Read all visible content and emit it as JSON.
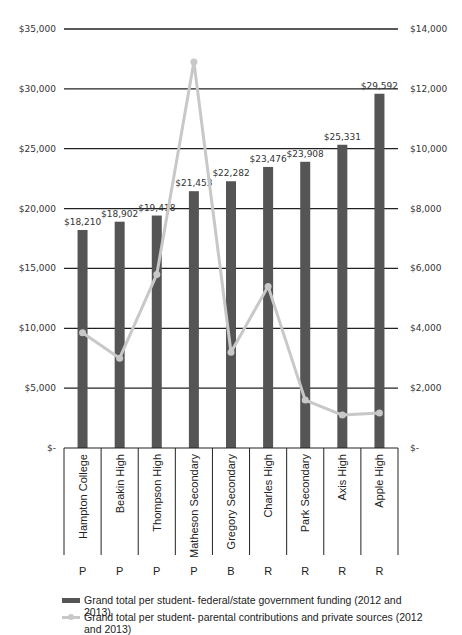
{
  "chart_data": {
    "type": "bar",
    "title": "",
    "xlabel": "",
    "ylabel": "",
    "categories": [
      "Hampton College",
      "Beakin High",
      "Thompson High",
      "Matheson Secondary",
      "Gregory Secondary",
      "Charles High",
      "Park Secondary",
      "Axis High",
      "Apple High"
    ],
    "groups": [
      "P",
      "P",
      "P",
      "P",
      "B",
      "R",
      "R",
      "R",
      "R"
    ],
    "series": [
      {
        "name": "Grand total per student- federal/state government funding (2012 and 2013)",
        "type": "bar",
        "axis": "left",
        "color": "#555555",
        "values": [
          18210,
          18902,
          19418,
          21453,
          22282,
          23476,
          23908,
          25331,
          29592
        ],
        "labels": [
          "$18,210",
          "$18,902",
          "$19,418",
          "$21,453",
          "$22,282",
          "$23,476",
          "$23,908",
          "$25,331",
          "$29,592"
        ]
      },
      {
        "name": "Grand total per student- parental contributions and private sources (2012 and 2013)",
        "type": "line",
        "axis": "right",
        "color": "#c8c8c8",
        "values": [
          3850,
          3000,
          5800,
          12900,
          3200,
          5400,
          1600,
          1100,
          1170
        ]
      }
    ],
    "left_axis": {
      "ylim": [
        0,
        35000
      ],
      "ticks": [
        0,
        5000,
        10000,
        15000,
        20000,
        25000,
        30000,
        35000
      ],
      "tick_labels": [
        "$-",
        "$5,000",
        "$10,000",
        "$15,000",
        "$20,000",
        "$25,000",
        "$30,000",
        "$35,000"
      ]
    },
    "right_axis": {
      "ylim": [
        0,
        14000
      ],
      "ticks": [
        0,
        2000,
        4000,
        6000,
        8000,
        10000,
        12000,
        14000
      ],
      "tick_labels": [
        "$-",
        "$2,000",
        "$4,000",
        "$6,000",
        "$8,000",
        "$10,000",
        "$12,000",
        "$14,000"
      ]
    },
    "grid": true,
    "legend_position": "bottom"
  },
  "legend": {
    "bar_label": "Grand total per student- federal/state government funding (2012 and 2013)",
    "line_label": "Grand total per student- parental contributions and private sources (2012 and 2013)"
  }
}
